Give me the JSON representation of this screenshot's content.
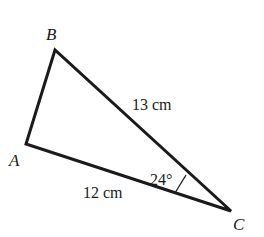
{
  "diagram": {
    "type": "triangle",
    "vertices": [
      {
        "label": "A"
      },
      {
        "label": "B"
      },
      {
        "label": "C"
      }
    ],
    "sides": [
      {
        "between": "B-C",
        "label": "13 cm"
      },
      {
        "between": "A-C",
        "label": "12 cm"
      }
    ],
    "angles": [
      {
        "at": "C",
        "label": "24°"
      }
    ],
    "stroke_color": "#1a1a1a",
    "background": "#ffffff"
  }
}
